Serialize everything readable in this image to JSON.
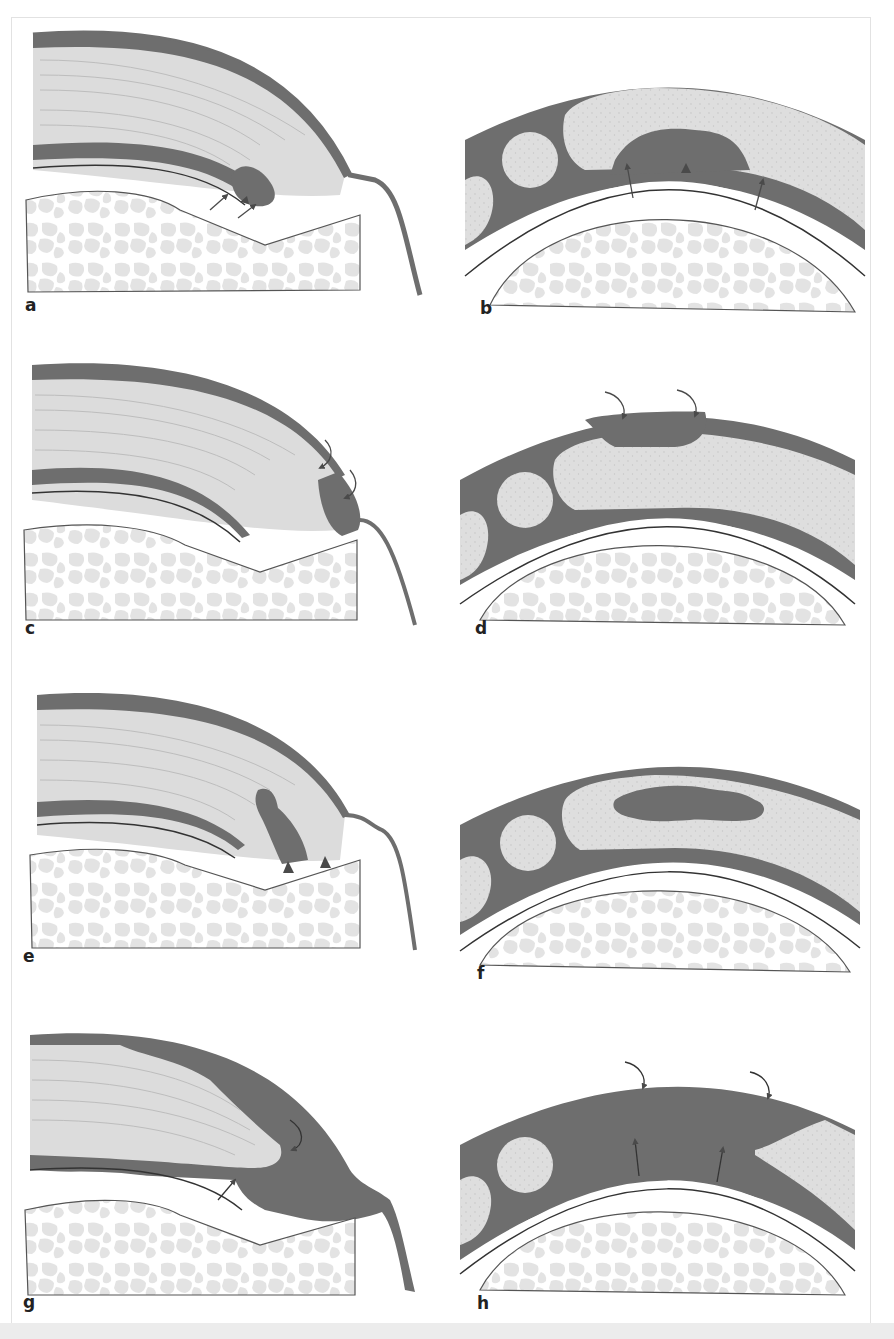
{
  "figure": {
    "panels": [
      {
        "id": "a",
        "label": "a",
        "view": "sagittal",
        "lesion": "undersurface partial tear",
        "markers": [
          "arrow",
          "arrowhead",
          "arrow"
        ]
      },
      {
        "id": "b",
        "label": "b",
        "view": "coronal",
        "lesion": "articular-side partial tear",
        "markers": [
          "arrow",
          "arrowhead",
          "arrow"
        ]
      },
      {
        "id": "c",
        "label": "c",
        "view": "sagittal",
        "lesion": "bursal-side partial tear",
        "markers": [
          "curved-arrow",
          "curved-arrow"
        ]
      },
      {
        "id": "d",
        "label": "d",
        "view": "coronal",
        "lesion": "bursal-side partial tear",
        "markers": [
          "curved-arrow",
          "curved-arrow"
        ]
      },
      {
        "id": "e",
        "label": "e",
        "view": "sagittal",
        "lesion": "intratendinous tear",
        "markers": [
          "arrowhead",
          "arrowhead"
        ]
      },
      {
        "id": "f",
        "label": "f",
        "view": "coronal",
        "lesion": "intratendinous tear",
        "markers": []
      },
      {
        "id": "g",
        "label": "g",
        "view": "sagittal",
        "lesion": "full-thickness tear",
        "markers": [
          "curved-arrow",
          "arrow"
        ]
      },
      {
        "id": "h",
        "label": "h",
        "view": "coronal",
        "lesion": "full-thickness tear",
        "markers": [
          "curved-arrow",
          "curved-arrow",
          "arrow",
          "arrow"
        ]
      }
    ],
    "colors": {
      "tendon_dark": "#6e6e6e",
      "tendon_light": "#dcdcdc",
      "bone_trabecula": "#e2e2e2",
      "outline": "#555555",
      "background": "#ffffff",
      "bottom_band": "#ececec"
    }
  }
}
